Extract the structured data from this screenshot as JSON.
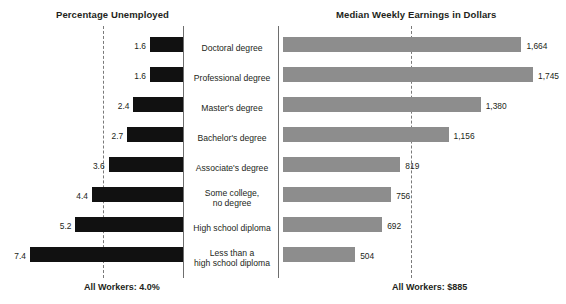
{
  "chart_data": {
    "type": "bar",
    "title": "",
    "orientation": "horizontal",
    "layout": "paired-diverging-panels",
    "grid": false,
    "legend": null,
    "categories": [
      "Doctoral degree",
      "Professional degree",
      "Master's degree",
      "Bachelor's degree",
      "Associate's degree",
      "Some college,\nno degree",
      "High school diploma",
      "Less than a\nhigh school diploma"
    ],
    "panels": [
      {
        "id": "unemployment",
        "title": "Percentage Unemployed",
        "xlabel": "",
        "ylabel": "",
        "unit": "percent",
        "direction": "right-to-left",
        "values": [
          1.6,
          1.6,
          2.4,
          2.7,
          3.6,
          4.4,
          5.2,
          7.4
        ],
        "value_labels": [
          "1.6",
          "1.6",
          "2.4",
          "2.7",
          "3.6",
          "4.4",
          "5.2",
          "7.4"
        ],
        "xlim": [
          0,
          7.4
        ],
        "bar_color": "#111111",
        "reference_line": {
          "value": 4.0,
          "label": "All Workers: 4.0%",
          "style": "dashed",
          "color": "#7a7a7a"
        }
      },
      {
        "id": "earnings",
        "title": "Median Weekly Earnings in Dollars",
        "xlabel": "",
        "ylabel": "",
        "unit": "dollars",
        "direction": "left-to-right",
        "values": [
          1664,
          1745,
          1380,
          1156,
          819,
          756,
          692,
          504
        ],
        "value_labels": [
          "1,664",
          "1,745",
          "1,380",
          "1,156",
          "819",
          "756",
          "692",
          "504"
        ],
        "xlim": [
          0,
          1745
        ],
        "bar_color": "#8d8d8d",
        "reference_line": {
          "value": 885,
          "label": "All Workers: $885",
          "style": "dashed",
          "color": "#7a7a7a"
        }
      }
    ]
  },
  "left_panel": {
    "title": "Percentage Unemployed",
    "footer": "All Workers: 4.0%"
  },
  "right_panel": {
    "title": "Median Weekly Earnings in Dollars",
    "footer": "All Workers: $885"
  },
  "rows": [
    {
      "label": "Doctoral degree",
      "unemp": "1.6",
      "earn": "1,664"
    },
    {
      "label": "Professional degree",
      "unemp": "1.6",
      "earn": "1,745"
    },
    {
      "label": "Master's degree",
      "unemp": "2.4",
      "earn": "1,380"
    },
    {
      "label": "Bachelor's degree",
      "unemp": "2.7",
      "earn": "1,156"
    },
    {
      "label": "Associate's degree",
      "unemp": "3.6",
      "earn": "819"
    },
    {
      "label": "Some college,\nno degree",
      "unemp": "4.4",
      "earn": "756"
    },
    {
      "label": "High school diploma",
      "unemp": "5.2",
      "earn": "692"
    },
    {
      "label": "Less than a\nhigh school diploma",
      "unemp": "7.4",
      "earn": "504"
    }
  ],
  "colors": {
    "unemployment_bar": "#111111",
    "earnings_bar": "#8d8d8d",
    "reference_line": "#7a7a7a",
    "text": "#231f20",
    "background": "#ffffff"
  }
}
